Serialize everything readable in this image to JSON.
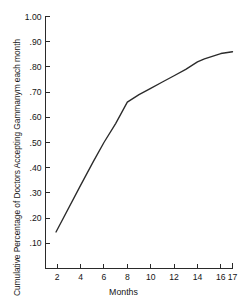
{
  "chart_data": {
    "type": "line",
    "title": "",
    "xlabel": "Months",
    "ylabel": "Cumulative Percentage of Doctors Accepting Gammanym each month",
    "x": [
      1.9,
      4.0,
      5.1,
      6.0,
      7.0,
      8.0,
      9.0,
      10.0,
      11.0,
      12.0,
      13.0,
      14.0,
      14.6,
      16.0,
      17.0
    ],
    "values": [
      0.145,
      0.33,
      0.425,
      0.5,
      0.575,
      0.66,
      0.69,
      0.715,
      0.74,
      0.765,
      0.79,
      0.82,
      0.832,
      0.853,
      0.86
    ],
    "series": [
      {
        "name": "Cumulative Percentage of Doctors Accepting Gammanym",
        "values": [
          0.145,
          0.33,
          0.425,
          0.5,
          0.575,
          0.66,
          0.69,
          0.715,
          0.74,
          0.765,
          0.79,
          0.82,
          0.832,
          0.853,
          0.86
        ]
      }
    ],
    "xlim": [
      1.0,
      17.0
    ],
    "ylim": [
      0.0,
      1.0
    ],
    "xticks": [
      2,
      4,
      6,
      8,
      10,
      12,
      14,
      16,
      17
    ],
    "xtick_labels": [
      "2",
      "4",
      "6",
      "8",
      "10",
      "12",
      "14",
      "16",
      "17"
    ],
    "yticks": [
      0.1,
      0.2,
      0.3,
      0.4,
      0.5,
      0.6,
      0.7,
      0.8,
      0.9,
      1.0
    ],
    "ytick_labels": [
      ".10",
      ".20",
      ".30",
      ".40",
      ".50",
      ".60",
      ".70",
      ".80",
      ".90",
      "1.00"
    ],
    "grid": false,
    "legend": null,
    "line_color": "#2b2b2b",
    "axis_color": "#2a2a2a",
    "background": "#ffffff"
  },
  "axes": {
    "y_title": "Cumulative Percentage of Doctors Accepting Gammanym each month",
    "x_title": "Months"
  }
}
